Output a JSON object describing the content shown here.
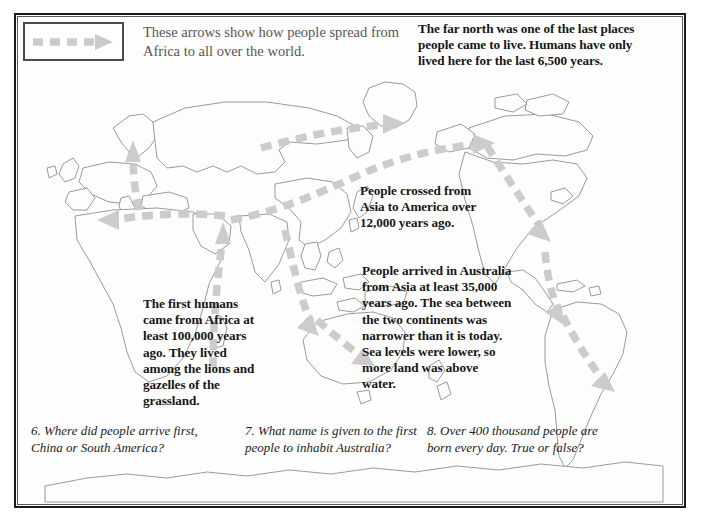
{
  "legend": {
    "caption": "These arrows show how people spread from Africa to all over the world.",
    "arrow_icon": "dashed-arrow-right-icon",
    "arrow_color": "#c9c9c9"
  },
  "notes": {
    "far_north": "The far north was one of the last places people came to live. Humans have only lived here for the last 6,500 years.",
    "asia_to_america": "People crossed from Asia to America over 12,000 years ago.",
    "australia": "People arrived in Australia from Asia at least 35,000 years ago. The sea between the two continents was narrower than it is today. Sea levels were lower, so more land was above water.",
    "africa": "The first humans came from Africa at least 100,000 years ago. They lived among the lions and gazelles of the grassland."
  },
  "questions": [
    "6. Where did people arrive first, China or South America?",
    "7. What name is given to the first people to inhabit Australia?",
    "8. Over 400 thousand people are born every day. True or false?"
  ],
  "map": {
    "coastline_color": "#8e8e8e",
    "land_fill": "#fdfdfd",
    "arrow_color": "#cccccc",
    "frame_color": "#1a1a1a",
    "background": "#ffffff"
  }
}
